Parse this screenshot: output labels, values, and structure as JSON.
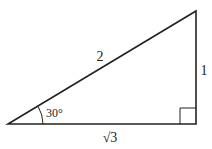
{
  "diagram": {
    "type": "right-triangle",
    "vertices": {
      "left": [
        8,
        124
      ],
      "right_angle": [
        196,
        124
      ],
      "top": [
        196,
        11
      ]
    },
    "labels": {
      "hypotenuse": "2",
      "vertical_leg": "1",
      "horizontal_leg": "√3",
      "angle": "30°"
    },
    "right_angle_marker": true,
    "stroke_color": "#222222"
  }
}
